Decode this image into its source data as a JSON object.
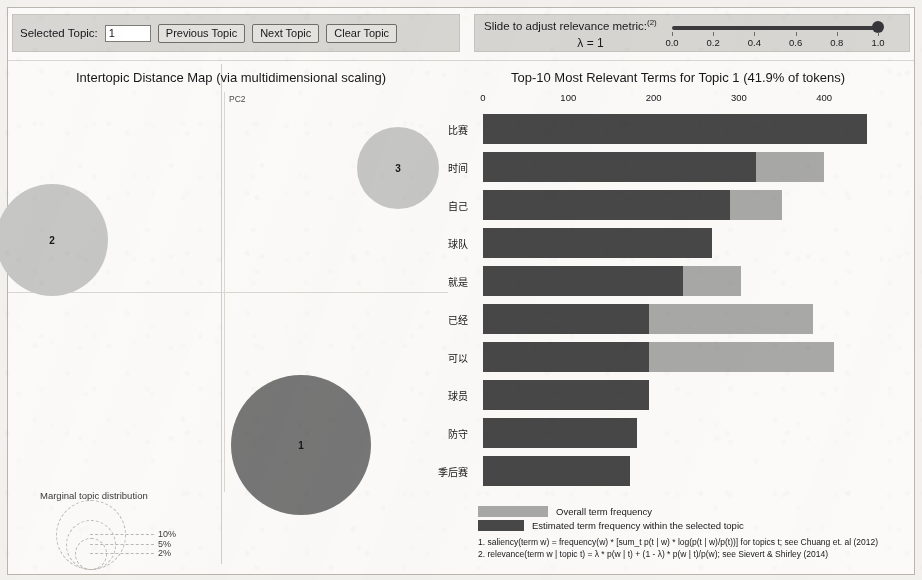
{
  "toolbar": {
    "selected_topic_label": "Selected Topic:",
    "selected_topic_value": "1",
    "previous_topic_label": "Previous Topic",
    "next_topic_label": "Next Topic",
    "clear_topic_label": "Clear Topic"
  },
  "relevance": {
    "title": "Slide to adjust relevance metric:",
    "superscript": "(2)",
    "lambda_label": "λ = 1",
    "slider_value": 1.0,
    "slider_min": 0.0,
    "slider_max": 1.0,
    "ticks": [
      "0.0",
      "0.2",
      "0.4",
      "0.6",
      "0.8",
      "1.0"
    ]
  },
  "left_panel": {
    "title": "Intertopic Distance Map (via multidimensional scaling)",
    "axis_x_label": "PC1",
    "axis_y_label": "PC2",
    "topics": [
      {
        "id": "1",
        "label": "1",
        "cx": 293,
        "cy": 437,
        "r": 70,
        "selected": true
      },
      {
        "id": "2",
        "label": "2",
        "cx": 44,
        "cy": 232,
        "r": 56,
        "selected": false
      },
      {
        "id": "3",
        "label": "3",
        "cx": 390,
        "cy": 160,
        "r": 41,
        "selected": false
      }
    ],
    "marginal_legend": {
      "title": "Marginal topic distribution",
      "entries": [
        {
          "pct": "2%",
          "r": 15
        },
        {
          "pct": "5%",
          "r": 24
        },
        {
          "pct": "10%",
          "r": 34
        }
      ]
    }
  },
  "right_panel": {
    "title": "Top-10 Most Relevant Terms for Topic 1 (41.9% of tokens)",
    "legend": {
      "overall_label": "Overall term frequency",
      "estimated_label": "Estimated term frequency within the selected topic",
      "overall_color": "#a8a8a6",
      "estimated_color": "#474747"
    },
    "footnotes": [
      "1. saliency(term w) = frequency(w) * [sum_t p(t | w) * log(p(t | w)/p(t))] for topics t; see Chuang et. al (2012)",
      "2. relevance(term w | topic t) = λ * p(w | t) + (1 - λ) * p(w | t)/p(w); see Sievert & Shirley (2014)"
    ]
  },
  "chart_data": {
    "type": "bar",
    "title": "Top-10 Most Relevant Terms for Topic 1 (41.9% of tokens)",
    "orientation": "horizontal",
    "xlabel": "",
    "ylabel": "",
    "xlim": [
      0,
      450
    ],
    "xticks": [
      0,
      100,
      200,
      300,
      400
    ],
    "grid": false,
    "legend_position": "bottom",
    "categories": [
      "比赛",
      "时间",
      "自己",
      "球队",
      "就是",
      "已经",
      "可以",
      "球员",
      "防守",
      "季后赛"
    ],
    "series": [
      {
        "name": "Overall term frequency",
        "color": "#a8a8a6",
        "values": [
          450,
          400,
          350,
          268,
          303,
          387,
          412,
          195,
          180,
          172
        ]
      },
      {
        "name": "Estimated term frequency within the selected topic",
        "color": "#474747",
        "values": [
          450,
          320,
          290,
          268,
          235,
          195,
          195,
          195,
          180,
          172
        ]
      }
    ]
  }
}
